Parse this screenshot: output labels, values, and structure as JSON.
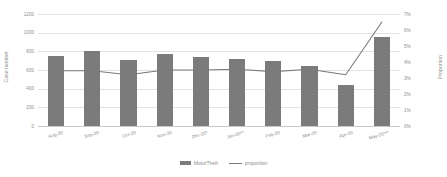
{
  "chart_data": {
    "type": "bar",
    "title": "",
    "xlabel": "",
    "ylabel": "Case number",
    "y2label": "Proportion",
    "categories": [
      "Aug-20",
      "Sep-20",
      "Oct-20",
      "Nov-20",
      "Dec-20*",
      "Jan-20**",
      "Feb-20",
      "Mar-20",
      "Apr-20",
      "May-20***"
    ],
    "series": [
      {
        "name": "MotorTheft",
        "type": "bar",
        "axis": "left",
        "values": [
          755,
          800,
          705,
          775,
          735,
          720,
          700,
          645,
          440,
          955
        ]
      },
      {
        "name": "proportion",
        "type": "line",
        "axis": "right",
        "values": [
          3.45,
          3.45,
          3.2,
          3.5,
          3.5,
          3.55,
          3.4,
          3.55,
          3.2,
          6.5
        ]
      }
    ],
    "ylim": [
      0,
      1200
    ],
    "yticks": [
      0,
      200,
      400,
      600,
      800,
      1000,
      1200
    ],
    "ytick_labels": [
      "0",
      "200",
      "400",
      "600",
      "800",
      "1000",
      "1200"
    ],
    "y2lim": [
      0,
      7
    ],
    "y2ticks": [
      0,
      1,
      2,
      3,
      4,
      5,
      6,
      7
    ],
    "y2tick_labels": [
      "0%",
      "1%",
      "2%",
      "3%",
      "4%",
      "5%",
      "6%",
      "7%"
    ],
    "grid": true,
    "legend_position": "bottom",
    "colors": {
      "bar": "#7b7b7b",
      "line": "#7b7b7b",
      "grid": "#e2e2e2",
      "text": "#8d8d8d",
      "background": "#ffffff"
    }
  },
  "legend": {
    "items": [
      {
        "label": "MotorTheft",
        "marker": "bar-swatch"
      },
      {
        "label": "proportion",
        "marker": "line-swatch"
      }
    ]
  }
}
